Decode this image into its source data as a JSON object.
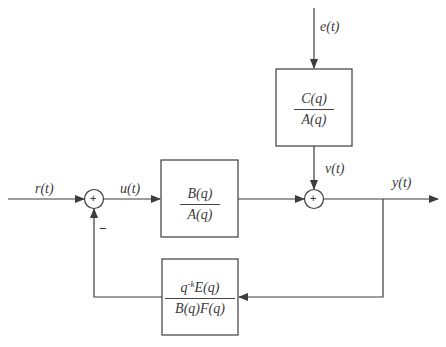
{
  "diagram": {
    "type": "control-system-block-diagram",
    "signals": {
      "reference": "r(t)",
      "control": "u(t)",
      "disturbance_input": "e(t)",
      "noise": "v(t)",
      "output": "y(t)"
    },
    "blocks": {
      "plant": {
        "numerator": "B(q)",
        "denominator": "A(q)"
      },
      "noise_model": {
        "numerator": "C(q)",
        "denominator": "A(q)"
      },
      "feedback": {
        "numerator_prefix": "q",
        "numerator_exponent": "-k",
        "numerator_rest": "E(q)",
        "denominator": "B(q)F(q)"
      }
    },
    "summing_junctions": {
      "input_sum": {
        "symbol": "+",
        "feedback_sign": "−"
      },
      "output_sum": {
        "symbol": "+"
      }
    },
    "colors": {
      "line": "#3c3c3c",
      "background": "#ffffff"
    }
  }
}
